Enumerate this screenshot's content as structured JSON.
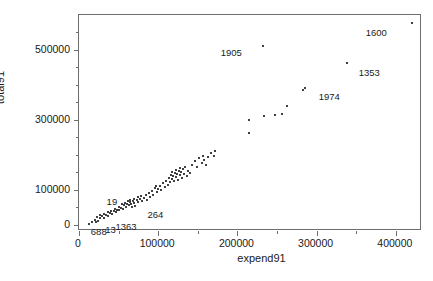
{
  "chart_data": {
    "type": "scatter",
    "title": "",
    "xlabel": "expend91",
    "ylabel": "total91",
    "xlim": [
      0,
      433000
    ],
    "ylim": [
      -18000,
      600000
    ],
    "grid": false,
    "legend": null,
    "marker": "small-filled-dot",
    "marker_color": "#000000",
    "x_ticks": [
      0,
      100000,
      200000,
      300000,
      400000
    ],
    "x_tick_labels": [
      "0",
      "100000",
      "200000",
      "300000",
      "400000"
    ],
    "x_minor_ticks": [
      50000,
      150000,
      250000,
      350000
    ],
    "y_ticks": [
      0,
      100000,
      300000,
      500000
    ],
    "y_tick_labels": [
      "0",
      "100000",
      "300000",
      "500000"
    ],
    "y_minor_ticks": [
      50000,
      150000,
      200000,
      250000,
      350000,
      400000,
      450000,
      550000
    ],
    "points": [
      [
        13000,
        3000
      ],
      [
        17000,
        9000
      ],
      [
        20000,
        14000
      ],
      [
        21000,
        7000
      ],
      [
        23000,
        21000
      ],
      [
        24000,
        12000
      ],
      [
        26000,
        27000
      ],
      [
        27000,
        18000
      ],
      [
        29000,
        24000
      ],
      [
        31000,
        31000
      ],
      [
        32000,
        20000
      ],
      [
        34000,
        28000
      ],
      [
        36000,
        35000
      ],
      [
        37000,
        26000
      ],
      [
        39000,
        33000
      ],
      [
        41000,
        40000
      ],
      [
        42000,
        30000
      ],
      [
        44000,
        38000
      ],
      [
        45000,
        45000
      ],
      [
        47000,
        36000
      ],
      [
        48000,
        43000
      ],
      [
        50000,
        52000
      ],
      [
        51000,
        41000
      ],
      [
        53000,
        49000
      ],
      [
        54000,
        58000
      ],
      [
        55000,
        46000
      ],
      [
        57000,
        55000
      ],
      [
        58000,
        63000
      ],
      [
        59000,
        51000
      ],
      [
        60000,
        60000
      ],
      [
        62000,
        68000
      ],
      [
        63000,
        56000
      ],
      [
        64000,
        65000
      ],
      [
        65000,
        72000
      ],
      [
        66000,
        59000
      ],
      [
        67000,
        50000
      ],
      [
        68000,
        67000
      ],
      [
        69000,
        75000
      ],
      [
        70000,
        62000
      ],
      [
        71000,
        54000
      ],
      [
        73000,
        70000
      ],
      [
        74000,
        78000
      ],
      [
        75000,
        64000
      ],
      [
        77000,
        73000
      ],
      [
        78000,
        81000
      ],
      [
        80000,
        69000
      ],
      [
        82000,
        76000
      ],
      [
        84000,
        84000
      ],
      [
        86000,
        72000
      ],
      [
        88000,
        90000
      ],
      [
        90000,
        79000
      ],
      [
        92000,
        97000
      ],
      [
        94000,
        86000
      ],
      [
        96000,
        105000
      ],
      [
        97000,
        112000
      ],
      [
        98000,
        94000
      ],
      [
        100000,
        103000
      ],
      [
        102000,
        110000
      ],
      [
        104000,
        99000
      ],
      [
        106000,
        118000
      ],
      [
        108000,
        107000
      ],
      [
        110000,
        126000
      ],
      [
        112000,
        115000
      ],
      [
        114000,
        134000
      ],
      [
        115000,
        122000
      ],
      [
        116000,
        143000
      ],
      [
        117000,
        131000
      ],
      [
        118000,
        152000
      ],
      [
        119000,
        140000
      ],
      [
        120000,
        124000
      ],
      [
        121000,
        148000
      ],
      [
        122000,
        136000
      ],
      [
        123000,
        157000
      ],
      [
        124000,
        145000
      ],
      [
        125000,
        129000
      ],
      [
        126000,
        153000
      ],
      [
        127000,
        141000
      ],
      [
        128000,
        162000
      ],
      [
        129000,
        150000
      ],
      [
        130000,
        133000
      ],
      [
        131000,
        158000
      ],
      [
        132000,
        146000
      ],
      [
        134000,
        166000
      ],
      [
        136000,
        138000
      ],
      [
        138000,
        155000
      ],
      [
        140000,
        147000
      ],
      [
        143000,
        172000
      ],
      [
        146000,
        181000
      ],
      [
        149000,
        164000
      ],
      [
        152000,
        190000
      ],
      [
        155000,
        178000
      ],
      [
        157000,
        198000
      ],
      [
        158000,
        186000
      ],
      [
        160000,
        170000
      ],
      [
        163000,
        193000
      ],
      [
        166000,
        205000
      ],
      [
        170000,
        196000
      ],
      [
        172000,
        212000
      ],
      [
        214000,
        261000
      ],
      [
        215000,
        299000
      ],
      [
        234000,
        310000
      ],
      [
        248000,
        313000
      ],
      [
        256000,
        318000
      ],
      [
        262000,
        340000
      ],
      [
        283000,
        385000
      ],
      [
        285000,
        392000
      ],
      [
        232000,
        510000
      ],
      [
        338000,
        462000
      ],
      [
        420000,
        578000
      ]
    ],
    "labeled_points": [
      {
        "label": "1600",
        "x": 420000,
        "y": 578000,
        "label_dx": -46,
        "label_dy": 10
      },
      {
        "label": "1353",
        "x": 338000,
        "y": 462000,
        "label_dx": 12,
        "label_dy": 10
      },
      {
        "label": "1974",
        "x": 285000,
        "y": 392000,
        "label_dx": 14,
        "label_dy": 9
      },
      {
        "label": "1905",
        "x": 232000,
        "y": 510000,
        "label_dx": -42,
        "label_dy": 7
      },
      {
        "label": "264",
        "x": 84000,
        "y": 55000,
        "label_dx": 2,
        "label_dy": 10
      },
      {
        "label": "19",
        "x": 50000,
        "y": 72000,
        "label_dx": -12,
        "label_dy": 2
      },
      {
        "label": "1363",
        "x": 46000,
        "y": 12000,
        "label_dx": 0,
        "label_dy": 6
      },
      {
        "label": "13",
        "x": 33000,
        "y": 7000,
        "label_dx": 0,
        "label_dy": 8
      },
      {
        "label": "688",
        "x": 20000,
        "y": 4000,
        "label_dx": -4,
        "label_dy": 9
      }
    ]
  },
  "axes": {
    "x_title": "expend91",
    "y_title": "total91"
  },
  "colors": {
    "frame": "#6e6e6e",
    "marker": "#000000",
    "text": "#1a1a1a",
    "background": "#ffffff"
  }
}
